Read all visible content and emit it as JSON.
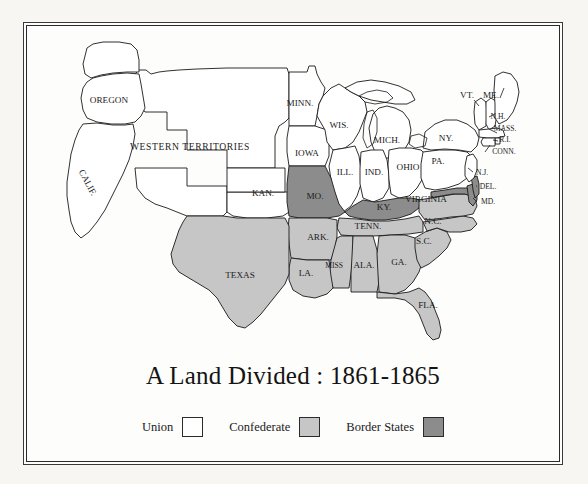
{
  "title": "A Land Divided : 1861-1865",
  "colors": {
    "union": "#ffffff",
    "confederate": "#c6c6c6",
    "border_state": "#8c8c8c",
    "outline": "#1a1a1a",
    "page_background": "#f7f6f3",
    "map_background": "#fdfdfb"
  },
  "legend": {
    "items": [
      {
        "label": "Union",
        "color": "#ffffff",
        "key": "union"
      },
      {
        "label": "Confederate",
        "color": "#c6c6c6",
        "key": "confederate"
      },
      {
        "label": "Border States",
        "color": "#8c8c8c",
        "key": "border_state"
      }
    ]
  },
  "map": {
    "region_label": "WESTERN TERRITORIES",
    "labels": [
      {
        "name": "OREGON",
        "text": "OREGON",
        "x": 82,
        "y": 75,
        "size": "lbl",
        "rotate": 0
      },
      {
        "name": "CALIF",
        "text": "CALIF.",
        "x": 60,
        "y": 157,
        "size": "lbl",
        "rotate": 62
      },
      {
        "name": "WESTERN-TERRITORIES",
        "text": "WESTERN TERRITORIES",
        "x": 163,
        "y": 122,
        "size": "lbl-wt",
        "rotate": 0
      },
      {
        "name": "MINN",
        "text": "MINN.",
        "x": 273,
        "y": 78,
        "size": "lbl",
        "rotate": 0
      },
      {
        "name": "WIS",
        "text": "WIS.",
        "x": 312,
        "y": 100,
        "size": "lbl",
        "rotate": 0
      },
      {
        "name": "MICH",
        "text": "MICH.",
        "x": 360,
        "y": 115,
        "size": "lbl",
        "rotate": 0
      },
      {
        "name": "IOWA",
        "text": "IOWA",
        "x": 280,
        "y": 128,
        "size": "lbl",
        "rotate": 0
      },
      {
        "name": "ILL",
        "text": "ILL.",
        "x": 318,
        "y": 147,
        "size": "lbl",
        "rotate": 0
      },
      {
        "name": "IND",
        "text": "IND.",
        "x": 347,
        "y": 147,
        "size": "lbl",
        "rotate": 0
      },
      {
        "name": "OHIO",
        "text": "OHIO",
        "x": 381,
        "y": 142,
        "size": "lbl",
        "rotate": 0
      },
      {
        "name": "KAN",
        "text": "KAN.",
        "x": 236,
        "y": 168,
        "size": "lbl",
        "rotate": 0
      },
      {
        "name": "MO",
        "text": "MO.",
        "x": 288,
        "y": 171,
        "size": "lbl",
        "rotate": 0
      },
      {
        "name": "KY",
        "text": "KY.",
        "x": 357,
        "y": 182,
        "size": "lbl",
        "rotate": 0
      },
      {
        "name": "TENN",
        "text": "TENN.",
        "x": 341,
        "y": 201,
        "size": "lbl",
        "rotate": 0
      },
      {
        "name": "ARK",
        "text": "ARK.",
        "x": 291,
        "y": 212,
        "size": "lbl",
        "rotate": 0
      },
      {
        "name": "MISS",
        "text": "MISS",
        "x": 307,
        "y": 240,
        "size": "lbl-sm",
        "rotate": 0
      },
      {
        "name": "ALA",
        "text": "ALA.",
        "x": 337,
        "y": 240,
        "size": "lbl",
        "rotate": 0
      },
      {
        "name": "GA",
        "text": "GA.",
        "x": 372,
        "y": 237,
        "size": "lbl",
        "rotate": 0
      },
      {
        "name": "LA",
        "text": "LA.",
        "x": 279,
        "y": 248,
        "size": "lbl",
        "rotate": 0
      },
      {
        "name": "TEXAS",
        "text": "TEXAS",
        "x": 213,
        "y": 250,
        "size": "lbl",
        "rotate": 0
      },
      {
        "name": "FLA",
        "text": "FLA.",
        "x": 401,
        "y": 280,
        "size": "lbl",
        "rotate": 0
      },
      {
        "name": "SC",
        "text": "S.C.",
        "x": 397,
        "y": 216,
        "size": "lbl",
        "rotate": 0
      },
      {
        "name": "NC",
        "text": "N.C.",
        "x": 406,
        "y": 196,
        "size": "lbl",
        "rotate": 0
      },
      {
        "name": "VIRGINIA",
        "text": "VIRGINIA",
        "x": 399,
        "y": 174,
        "size": "lbl",
        "rotate": 0
      },
      {
        "name": "PA",
        "text": "PA.",
        "x": 411,
        "y": 136,
        "size": "lbl",
        "rotate": 0
      },
      {
        "name": "NY",
        "text": "NY.",
        "x": 419,
        "y": 113,
        "size": "lbl",
        "rotate": 0
      },
      {
        "name": "VT",
        "text": "VT.",
        "x": 440,
        "y": 70,
        "size": "lbl",
        "rotate": 0
      },
      {
        "name": "ME",
        "text": "ME.",
        "x": 464,
        "y": 70,
        "size": "lbl",
        "rotate": 0
      },
      {
        "name": "NH",
        "text": "N.H.",
        "x": 471,
        "y": 91,
        "size": "lbl-sm",
        "rotate": 0
      },
      {
        "name": "MASS",
        "text": "MASS.",
        "x": 478,
        "y": 103,
        "size": "lbl-sm",
        "rotate": 0
      },
      {
        "name": "RI",
        "text": "R.I.",
        "x": 478,
        "y": 114,
        "size": "lbl-sm",
        "rotate": 0
      },
      {
        "name": "CONN",
        "text": "CONN.",
        "x": 477,
        "y": 126,
        "size": "lbl-sm",
        "rotate": 0
      },
      {
        "name": "NJ",
        "text": "N.J.",
        "x": 455,
        "y": 147,
        "size": "lbl-sm",
        "rotate": 0
      },
      {
        "name": "DEL",
        "text": "DEL.",
        "x": 461,
        "y": 161,
        "size": "lbl-sm",
        "rotate": 0
      },
      {
        "name": "MD",
        "text": "MD.",
        "x": 461,
        "y": 176,
        "size": "lbl-sm",
        "rotate": 0
      }
    ],
    "state_fills": {
      "union": [
        "OREGON",
        "CALIF",
        "KAN",
        "MINN",
        "WIS",
        "MICH",
        "IOWA",
        "ILL",
        "IND",
        "OHIO",
        "PA",
        "NY",
        "VT",
        "ME",
        "NH",
        "MASS",
        "RI",
        "CONN",
        "NJ",
        "WESTERN-TERRITORIES"
      ],
      "confederate": [
        "TEXAS",
        "LA",
        "ARK",
        "MISS",
        "ALA",
        "GA",
        "FLA",
        "SC",
        "NC",
        "VIRGINIA",
        "TENN"
      ],
      "border_state": [
        "MO",
        "KY",
        "MD",
        "DEL"
      ]
    }
  }
}
